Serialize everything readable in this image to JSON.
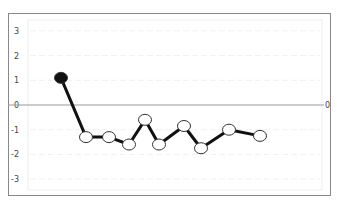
{
  "chart_data": {
    "type": "line",
    "title": "",
    "xlabel": "",
    "ylabel": "",
    "ylim": [
      -3.5,
      3.5
    ],
    "yticks": [
      3,
      2,
      1,
      0,
      -1,
      -2,
      -3
    ],
    "grid": true,
    "reference_line": {
      "y": 0,
      "label": "0",
      "color": "#999999"
    },
    "x": [
      1,
      2,
      3,
      4,
      5,
      6,
      7,
      8,
      9,
      10
    ],
    "series": [
      {
        "name": "series",
        "values": [
          1.1,
          -1.3,
          -1.3,
          -1.6,
          -0.6,
          -1.6,
          -0.85,
          -1.75,
          -1.0,
          -1.25
        ],
        "line_color": "#111111",
        "marker_fill": "#ffffff",
        "first_marker_fill": "#111111"
      }
    ]
  }
}
